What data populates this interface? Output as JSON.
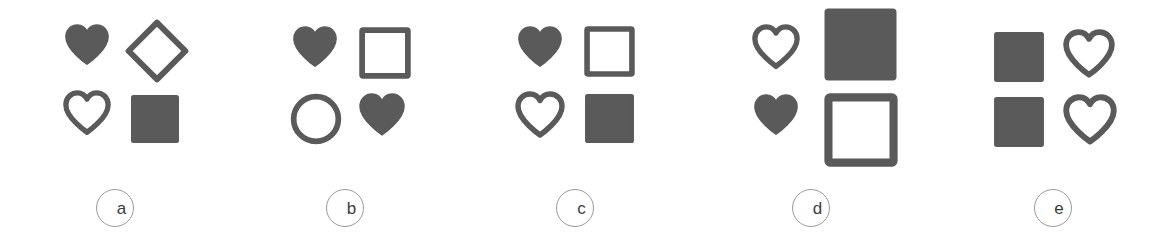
{
  "figure": {
    "title": "",
    "background_color": "#ffffff",
    "shape_color": "#5a5a5a",
    "label_circle_color": "#9a9a9a",
    "label_text_color": "#3c3c3c"
  },
  "panels": [
    {
      "id": "panel-a",
      "label": "a",
      "left": 0,
      "width": 230,
      "cells": [
        {
          "name": "heart-filled",
          "shape": "heart",
          "style": "filled",
          "row": 0,
          "col": 0,
          "x": 63,
          "y": 22,
          "size": 48
        },
        {
          "name": "diamond-outline",
          "shape": "diamond",
          "style": "outline",
          "row": 0,
          "col": 1,
          "x": 124,
          "y": 18,
          "size": 66
        },
        {
          "name": "heart-outline",
          "shape": "heart",
          "style": "outline",
          "row": 1,
          "col": 0,
          "x": 63,
          "y": 90,
          "size": 48
        },
        {
          "name": "square-filled",
          "shape": "square",
          "style": "filled",
          "row": 1,
          "col": 1,
          "x": 130,
          "y": 94,
          "size": 50
        }
      ]
    },
    {
      "id": "panel-b",
      "label": "b",
      "left": 230,
      "width": 230,
      "cells": [
        {
          "name": "heart-filled",
          "shape": "heart",
          "style": "filled",
          "row": 0,
          "col": 0,
          "x": 61,
          "y": 24,
          "size": 48
        },
        {
          "name": "square-outline",
          "shape": "square",
          "style": "outline",
          "row": 0,
          "col": 1,
          "x": 129,
          "y": 27,
          "size": 52
        },
        {
          "name": "circle-outline",
          "shape": "circle",
          "style": "outline",
          "row": 1,
          "col": 0,
          "x": 60,
          "y": 93,
          "size": 52
        },
        {
          "name": "heart-filled-2",
          "shape": "heart",
          "style": "filled",
          "row": 1,
          "col": 1,
          "x": 127,
          "y": 91,
          "size": 50
        }
      ]
    },
    {
      "id": "panel-c",
      "label": "c",
      "left": 460,
      "width": 230,
      "cells": [
        {
          "name": "heart-filled",
          "shape": "heart",
          "style": "filled",
          "row": 0,
          "col": 0,
          "x": 56,
          "y": 24,
          "size": 48
        },
        {
          "name": "square-outline",
          "shape": "square",
          "style": "outline",
          "row": 0,
          "col": 1,
          "x": 124,
          "y": 26,
          "size": 51
        },
        {
          "name": "heart-outline",
          "shape": "heart",
          "style": "outline",
          "row": 1,
          "col": 0,
          "x": 55,
          "y": 91,
          "size": 50
        },
        {
          "name": "square-filled",
          "shape": "square",
          "style": "filled",
          "row": 1,
          "col": 1,
          "x": 124,
          "y": 93,
          "size": 51
        }
      ]
    },
    {
      "id": "panel-d",
      "label": "d",
      "left": 690,
      "width": 242,
      "cells": [
        {
          "name": "heart-outline",
          "shape": "heart",
          "style": "outline",
          "row": 0,
          "col": 0,
          "x": 62,
          "y": 24,
          "size": 48
        },
        {
          "name": "square-filled-large",
          "shape": "square",
          "style": "filled",
          "row": 0,
          "col": 1,
          "x": 133,
          "y": 7,
          "size": 75
        },
        {
          "name": "heart-filled",
          "shape": "heart",
          "style": "filled",
          "row": 1,
          "col": 0,
          "x": 62,
          "y": 92,
          "size": 48
        },
        {
          "name": "square-outline-large",
          "shape": "square",
          "style": "outline",
          "row": 1,
          "col": 1,
          "x": 134,
          "y": 93,
          "size": 74
        }
      ]
    },
    {
      "id": "panel-e",
      "label": "e",
      "left": 932,
      "width": 241,
      "cells": [
        {
          "name": "square-filled",
          "shape": "square",
          "style": "filled",
          "row": 0,
          "col": 0,
          "x": 61,
          "y": 31,
          "size": 52
        },
        {
          "name": "heart-outline",
          "shape": "heart",
          "style": "outline",
          "row": 0,
          "col": 1,
          "x": 131,
          "y": 29,
          "size": 52
        },
        {
          "name": "square-filled-2",
          "shape": "square",
          "style": "filled",
          "row": 1,
          "col": 0,
          "x": 61,
          "y": 96,
          "size": 52
        },
        {
          "name": "heart-outline-2",
          "shape": "heart",
          "style": "outline",
          "row": 1,
          "col": 1,
          "x": 131,
          "y": 94,
          "size": 54
        }
      ]
    }
  ]
}
